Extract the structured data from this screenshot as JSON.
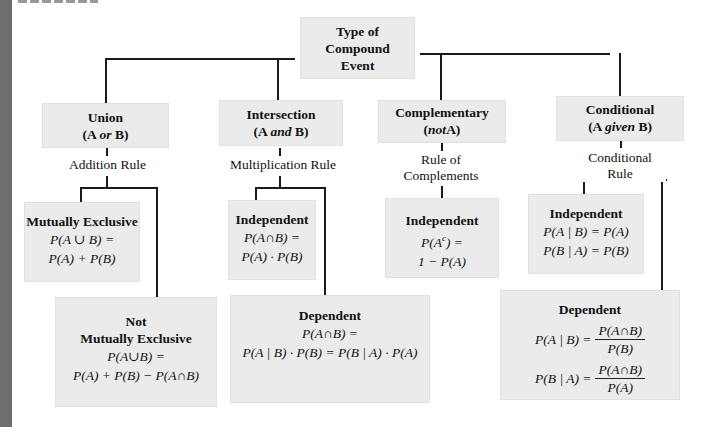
{
  "root": {
    "label_lines": [
      "Type of",
      "Compound",
      "Event"
    ]
  },
  "categories": [
    {
      "id": "union",
      "title": "Union",
      "subtitle_prefix": "(A ",
      "subtitle_italic": "or",
      "subtitle_suffix": " B)",
      "rule_lines": [
        "Addition Rule"
      ]
    },
    {
      "id": "intersection",
      "title": "Intersection",
      "subtitle_prefix": "(A ",
      "subtitle_italic": "and",
      "subtitle_suffix": " B)",
      "rule_lines": [
        "Multiplication Rule"
      ]
    },
    {
      "id": "complementary",
      "title": "Complementary",
      "subtitle_prefix": "(",
      "subtitle_italic": "not",
      "subtitle_suffix": "A)",
      "rule_lines": [
        "Rule of",
        "Complements"
      ]
    },
    {
      "id": "conditional",
      "title": "Conditional",
      "subtitle_prefix": "(A ",
      "subtitle_italic": "given",
      "subtitle_suffix": " B)",
      "rule_lines": [
        "Conditional Rule"
      ]
    }
  ],
  "leaves": {
    "union_mutually_exclusive": {
      "title": "Mutually Exclusive",
      "formula_lines": [
        "P(A ∪ B) =",
        "P(A) + P(B)"
      ]
    },
    "union_not_mutually_exclusive": {
      "title_lines": [
        "Not",
        "Mutually Exclusive"
      ],
      "formula_lines": [
        "P(A∪B) =",
        "P(A) + P(B) − P(A∩B)"
      ]
    },
    "intersection_independent": {
      "title": "Independent",
      "formula_lines": [
        "P(A∩B) =",
        "P(A) · P(B)"
      ]
    },
    "intersection_dependent": {
      "title": "Dependent",
      "formula_lines": [
        "P(A∩B) =",
        "P(A | B) · P(B) = P(B | A) · P(A)"
      ]
    },
    "complement_independent": {
      "title": "Independent",
      "formula_line1_pre": "P(A",
      "formula_line1_sup": "c",
      "formula_line1_post": ") =",
      "formula_line2": "1 − P(A)"
    },
    "conditional_independent": {
      "title": "Independent",
      "formula_lines": [
        "P(A | B) = P(A)",
        "P(B | A) = P(B)"
      ]
    },
    "conditional_dependent": {
      "title": "Dependent",
      "equations": [
        {
          "lhs": "P(A | B) =",
          "numerator": "P(A∩B)",
          "denominator": "P(B)"
        },
        {
          "lhs": "P(B | A) =",
          "numerator": "P(A∩B)",
          "denominator": "P(A)"
        }
      ]
    }
  },
  "colors": {
    "box_fill": "#ebebeb",
    "line": "#1a1a1a",
    "left_bar": "#6e6e6e"
  }
}
